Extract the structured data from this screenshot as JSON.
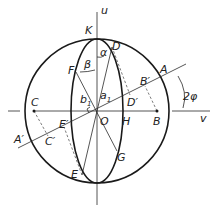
{
  "diagram": {
    "type": "geometric construction (Mohr circle / ellipse)",
    "axes": {
      "vertical": "u",
      "horizontal": "v"
    },
    "points": [
      "K",
      "D",
      "F",
      "A",
      "B'",
      "D'",
      "C",
      "E'",
      "O",
      "H",
      "B",
      "A'",
      "C'",
      "G",
      "E"
    ],
    "labels": {
      "u": "u",
      "v": "v",
      "K": "K",
      "D": "D",
      "F": "F",
      "A": "A",
      "B_prime": "B′",
      "D_prime": "D′",
      "C": "C",
      "E_prime": "E′",
      "O": "O",
      "H": "H",
      "B": "B",
      "A_prime": "A′",
      "C_prime": "C′",
      "G": "G",
      "E": "E",
      "alpha": "α",
      "beta": "β",
      "a1": "a",
      "a1_sub": "1",
      "b1": "b",
      "b1_sub": "1",
      "two_phi": "2φ"
    },
    "colors": {
      "stroke": "#1a1a1a",
      "background": "#ffffff"
    }
  }
}
